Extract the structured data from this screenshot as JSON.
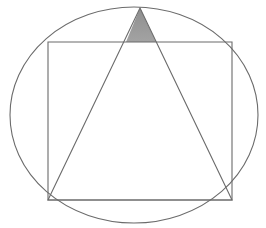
{
  "figure": {
    "background_color": "#ffffff",
    "width": 266,
    "height": 228,
    "stroke_color": "#6b6b6b",
    "shaded_fill_color": "#9a9a9a",
    "shaded_region_label": "shaded triangular cap above square top edge",
    "shapes": [
      {
        "name": "ellipse",
        "label": "Circle",
        "cx": 134,
        "cy": 115,
        "rx": 124,
        "ry": 108,
        "stroke": "#6b6b6b",
        "stroke_width": 1.1,
        "fill": "none"
      },
      {
        "name": "square",
        "label": "Square",
        "points": "48,42 232,42 232,200 48,200",
        "stroke": "#6b6b6b",
        "stroke_width": 1.1,
        "fill": "none"
      },
      {
        "name": "triangle",
        "label": "Triangle",
        "points": "140,8 232,200 48,200",
        "stroke": "#6b6b6b",
        "stroke_width": 1.1,
        "fill": "none"
      },
      {
        "name": "shaded-cap",
        "label": "Shaded region",
        "points": "140,8 156,42 126,42",
        "stroke": "none",
        "stroke_width": 0,
        "fill": "#9a9a9a"
      }
    ]
  }
}
